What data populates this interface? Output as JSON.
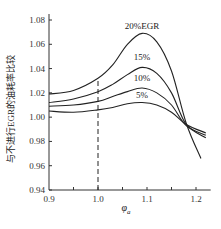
{
  "chart_data": {
    "type": "line",
    "title": "",
    "xlabel": "φ_a",
    "ylabel": "与不进行EGR的油耗率比较",
    "xlim": [
      0.9,
      1.23
    ],
    "ylim": [
      0.94,
      1.08
    ],
    "xticks": [
      0.9,
      1.0,
      1.1,
      1.2
    ],
    "xtick_labels": [
      "0.9",
      "1.0",
      "1.1",
      "1.2"
    ],
    "yticks": [
      0.94,
      0.96,
      0.98,
      1.0,
      1.02,
      1.04,
      1.06,
      1.08
    ],
    "ytick_labels": [
      "0.94",
      "0.96",
      "0.98",
      "1.00",
      "1.02",
      "1.04",
      "1.06",
      "1.08"
    ],
    "grid": false,
    "reference_line": {
      "x": 1.0,
      "style": "dashed"
    },
    "series": [
      {
        "name": "20%EGR",
        "label": "20%EGR",
        "x": [
          0.9,
          0.95,
          1.0,
          1.03,
          1.06,
          1.09,
          1.12,
          1.15,
          1.18,
          1.21
        ],
        "y": [
          1.019,
          1.022,
          1.032,
          1.043,
          1.06,
          1.069,
          1.062,
          1.038,
          0.995,
          0.966
        ]
      },
      {
        "name": "15%",
        "label": "15%",
        "x": [
          0.9,
          0.95,
          1.0,
          1.03,
          1.06,
          1.09,
          1.12,
          1.15,
          1.18,
          1.22
        ],
        "y": [
          1.012,
          1.015,
          1.021,
          1.027,
          1.035,
          1.041,
          1.036,
          1.02,
          0.994,
          0.983
        ]
      },
      {
        "name": "10%",
        "label": "10%",
        "x": [
          0.9,
          0.95,
          1.0,
          1.03,
          1.06,
          1.09,
          1.12,
          1.15,
          1.18,
          1.22
        ],
        "y": [
          1.009,
          1.01,
          1.013,
          1.017,
          1.021,
          1.024,
          1.02,
          1.01,
          0.993,
          0.985
        ]
      },
      {
        "name": "5%",
        "label": "5%",
        "x": [
          0.9,
          0.95,
          1.0,
          1.03,
          1.06,
          1.09,
          1.12,
          1.15,
          1.18,
          1.22
        ],
        "y": [
          1.005,
          1.004,
          1.006,
          1.008,
          1.011,
          1.012,
          1.01,
          1.004,
          0.994,
          0.987
        ]
      }
    ]
  }
}
